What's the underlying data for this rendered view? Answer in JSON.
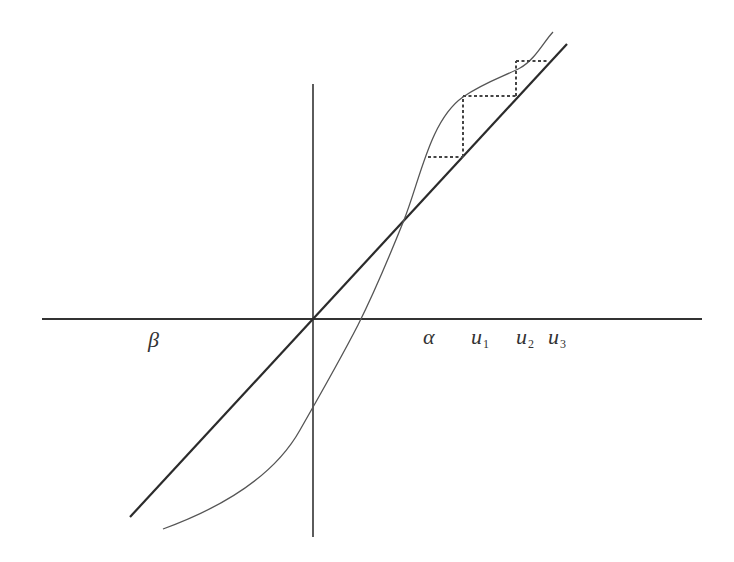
{
  "diagram": {
    "type": "cobweb-plot",
    "colors": {
      "background": "#ffffff",
      "axis": "#333333",
      "diagonal": "#2b2b2b",
      "curve": "#555555",
      "cobweb": "#444444"
    },
    "axes": {
      "origin": [
        313,
        319
      ],
      "horizontal": {
        "x1": 42,
        "x2": 702,
        "y": 319
      },
      "vertical": {
        "x": 313,
        "y1": 84,
        "y2": 537
      }
    },
    "diagonal_line": {
      "x1": 130,
      "y1": 517,
      "x2": 567,
      "y2": 44
    },
    "curve_path": "M163,529 C215,510 272,480 300,430 C320,395 340,360 358,325 C378,285 392,250 404,220 C420,180 430,120 463,97 C485,82 505,76 520,68 C535,60 545,40 553,32",
    "cobweb_segments": [
      {
        "x1": 428,
        "y1": 157,
        "x2": 463,
        "y2": 157
      },
      {
        "x1": 463,
        "y1": 157,
        "x2": 463,
        "y2": 96
      },
      {
        "x1": 463,
        "y1": 96,
        "x2": 516,
        "y2": 96
      },
      {
        "x1": 516,
        "y1": 96,
        "x2": 516,
        "y2": 61
      },
      {
        "x1": 516,
        "y1": 61,
        "x2": 549,
        "y2": 61
      }
    ],
    "labels": {
      "beta": {
        "text": "β",
        "sub": ""
      },
      "alpha": {
        "text": "α",
        "sub": ""
      },
      "u1": {
        "text": "u",
        "sub": "1"
      },
      "u2": {
        "text": "u",
        "sub": "2"
      },
      "u3": {
        "text": "u",
        "sub": "3"
      }
    }
  }
}
